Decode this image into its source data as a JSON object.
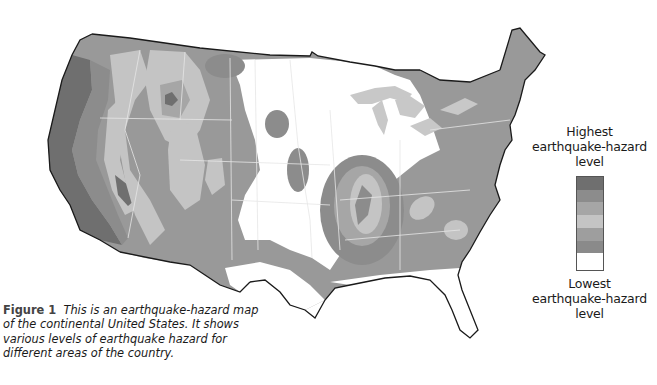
{
  "figure": {
    "label": "Figure 1",
    "caption": "This is an earthquake-hazard map of the continental United States. It shows various levels of earthquake hazard for different areas of the country."
  },
  "legend": {
    "top_label": "Highest earthquake-hazard level",
    "top_label_lines": [
      "Highest",
      "earthquake-hazard",
      "level"
    ],
    "bottom_label_lines": [
      "Lowest",
      "earthquake-hazard",
      "level"
    ],
    "bottom_label": "Lowest earthquake-hazard level",
    "swatches": [
      {
        "level": 7,
        "color": "#6f6f6f"
      },
      {
        "level": 6,
        "color": "#8c8c8c"
      },
      {
        "level": 5,
        "color": "#a6a6a6"
      },
      {
        "level": 4,
        "color": "#c4c4c4"
      },
      {
        "level": 3,
        "color": "#9e9e9e"
      },
      {
        "level": 2,
        "color": "#8a8a8a"
      },
      {
        "level": 1,
        "color": "#ffffff"
      }
    ]
  },
  "map": {
    "title": "Continental United States earthquake-hazard map",
    "colors": {
      "highest": "#6f6f6f",
      "high": "#8c8c8c",
      "medium_high": "#a6a6a6",
      "medium": "#c4c4c4",
      "low": "#9e9e9e",
      "lower": "#8a8a8a",
      "lowest": "#ffffff",
      "water": "#c8c8c8",
      "outline": "#1a1a1a",
      "state_border": "#e6e6e6"
    }
  }
}
